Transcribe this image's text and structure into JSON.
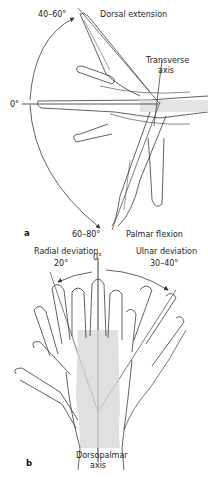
{
  "figure": {
    "panel_a": {
      "letter": "a",
      "labels": {
        "extension_angle": "40–60°",
        "extension_title": "Dorsal extension",
        "transverse_axis": "Transverse\naxis",
        "transverse_line1": "Transverse",
        "transverse_line2": "axis",
        "zero": "0°",
        "flexion_angle": "60–80°",
        "flexion_title": "Palmar flexion"
      }
    },
    "panel_b": {
      "letter": "b",
      "labels": {
        "radial_title": "Radial deviation",
        "radial_angle": "20°",
        "zero": "0°",
        "ulnar_title": "Ulnar deviation",
        "ulnar_angle": "30–40°",
        "axis_line1": "Dorsopalmar",
        "axis_line2": "axis"
      }
    },
    "caption_partial": "",
    "colors": {
      "line": "#3a3a3a",
      "bone_shade": "#c9c9c9",
      "axis": "#222222"
    }
  }
}
